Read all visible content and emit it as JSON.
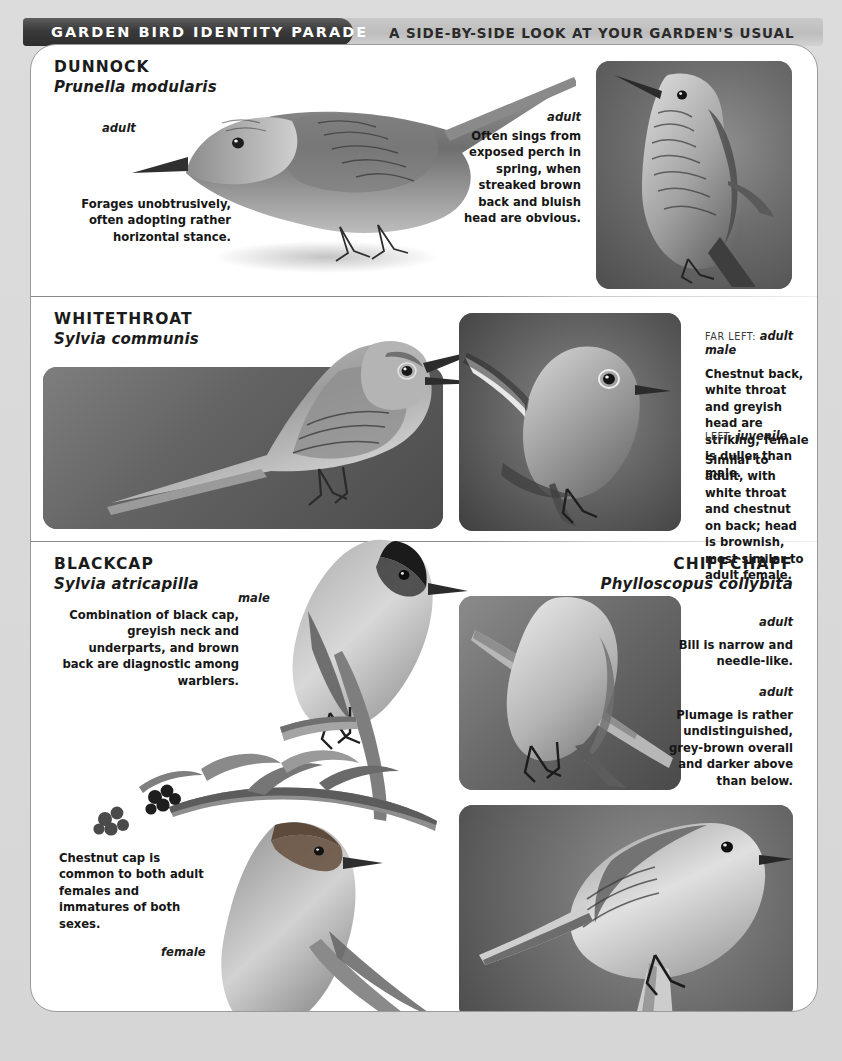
{
  "header": {
    "title": "GARDEN BIRD IDENTITY PARADE",
    "subtitle": "A SIDE-BY-SIDE LOOK AT YOUR GARDEN'S USUAL SUSPECTS"
  },
  "sections": [
    {
      "id": "dunnock",
      "name": "DUNNOCK",
      "latin": "Prunella modularis",
      "labels": {
        "illustration": "adult",
        "photo": "adult"
      },
      "captions": {
        "left": "Forages unobtrusively, often adopting rather horizontal stance.",
        "right": "Often sings from exposed perch in spring, when streaked brown back and bluish head are obvious."
      }
    },
    {
      "id": "whitethroat",
      "name": "WHITETHROAT",
      "latin": "Sylvia communis",
      "notes": [
        {
          "position": "FAR LEFT:",
          "subject": "adult male",
          "text": "Chestnut back, white throat and greyish head are striking; female is duller than male."
        },
        {
          "position": "LEFT:",
          "subject": "juvenile",
          "text": "Similar to adult, with white throat and chestnut on back; head is brownish, most similar to adult female."
        }
      ]
    },
    {
      "id": "blackcap",
      "name": "BLACKCAP",
      "latin": "Sylvia atricapilla",
      "labels": {
        "male": "male",
        "female": "female"
      },
      "captions": {
        "top": "Combination of black cap, greyish neck and underparts, and brown back are diagnostic among warblers.",
        "bottom": "Chestnut cap is common to both adult females and immatures of both sexes."
      }
    },
    {
      "id": "chiffchaff",
      "name": "CHIFFCHAFF",
      "latin": "Phylloscopus collybita",
      "labels": {
        "photo_top": "adult",
        "photo_bottom": "adult"
      },
      "captions": {
        "top": "Bill is narrow and needle-like.",
        "bottom": "Plumage is rather undistinguished, grey-brown overall and darker above than below."
      }
    }
  ],
  "colors": {
    "header_tab": "#333333",
    "header_band": "#c4c4c4",
    "card": "#ffffff",
    "page": "#d8d8d8",
    "text": "#161616",
    "rule": "#8a8a8a"
  }
}
